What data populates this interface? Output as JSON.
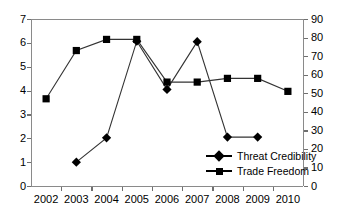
{
  "chart_data": {
    "type": "line",
    "title": "",
    "xlabel": "",
    "ylabel": "",
    "categories": [
      "2002",
      "2003",
      "2004",
      "2005",
      "2006",
      "2007",
      "2008",
      "2009",
      "2010"
    ],
    "grid": false,
    "legend_position": "inside-bottom-right",
    "axes": {
      "left": {
        "label": "",
        "ylim": [
          0,
          7
        ],
        "ticks": [
          0,
          1,
          2,
          3,
          4,
          5,
          6,
          7
        ],
        "tick_labels": [
          "0",
          "1",
          "2",
          "3",
          "4",
          "5",
          "6",
          "7"
        ],
        "applies_to": "Threat Credibility"
      },
      "right": {
        "label": "",
        "ylim": [
          0,
          90
        ],
        "ticks": [
          0,
          10,
          20,
          30,
          40,
          50,
          60,
          70,
          80,
          90
        ],
        "tick_labels": [
          "0",
          "10",
          "20",
          "30",
          "40",
          "50",
          "60",
          "70",
          "80",
          "90"
        ],
        "applies_to": "Trade Freedom"
      }
    },
    "series": [
      {
        "name": "Threat Credibility",
        "axis": "left",
        "marker": "diamond",
        "x": [
          "2003",
          "2004",
          "2005",
          "2006",
          "2007",
          "2008",
          "2009"
        ],
        "values": [
          1.0,
          2.02,
          6.07,
          4.05,
          6.05,
          2.05,
          2.05
        ]
      },
      {
        "name": "Trade Freedom",
        "axis": "right",
        "marker": "square",
        "x": [
          "2002",
          "2003",
          "2004",
          "2005",
          "2006",
          "2007",
          "2008",
          "2009",
          "2010"
        ],
        "values": [
          47,
          73,
          79,
          79,
          56,
          56,
          58,
          58,
          51
        ]
      }
    ]
  },
  "legend": {
    "items": [
      {
        "label": "Threat Credibility",
        "marker": "diamond"
      },
      {
        "label": "Trade Freedom",
        "marker": "square"
      }
    ]
  },
  "colors": {
    "series_marker": "#000000",
    "series_line": "#333333",
    "frame": "#8a8a8a",
    "tick": "#6f6f6f",
    "text": "#000000",
    "background": "#ffffff"
  }
}
